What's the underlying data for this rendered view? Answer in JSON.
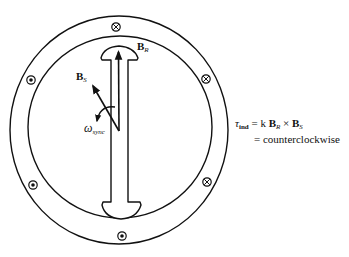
{
  "figure": {
    "type": "synchronous-machine-cross-section",
    "stroke_color": "#111111",
    "background": "#ffffff"
  },
  "stator": {
    "outer_ring": {
      "cx": 119,
      "cy": 130,
      "rx": 109,
      "ry": 114
    },
    "inner_ring": {
      "cx": 120,
      "cy": 127,
      "rx": 92,
      "ry": 91
    }
  },
  "conductors": [
    {
      "position": "top",
      "symbol": "cross",
      "meaning": "current-into-page",
      "x": 116,
      "y": 27
    },
    {
      "position": "upper-right",
      "symbol": "cross",
      "meaning": "current-into-page",
      "x": 206,
      "y": 79
    },
    {
      "position": "lower-right",
      "symbol": "cross",
      "meaning": "current-into-page",
      "x": 207,
      "y": 182
    },
    {
      "position": "bottom",
      "symbol": "dot",
      "meaning": "current-out-of-page",
      "x": 122,
      "y": 236
    },
    {
      "position": "lower-left",
      "symbol": "dot",
      "meaning": "current-out-of-page",
      "x": 33,
      "y": 185
    },
    {
      "position": "upper-left",
      "symbol": "dot",
      "meaning": "current-out-of-page",
      "x": 31,
      "y": 80
    }
  ],
  "labels": {
    "br": {
      "main": "B",
      "sub": "R"
    },
    "bs": {
      "main": "B",
      "sub": "S"
    },
    "omega": {
      "main": "ω",
      "sub": "sync"
    }
  },
  "equation": {
    "tau": "τ",
    "tau_sub": "ind",
    "line1_rest_k": "= k ",
    "b1": "B",
    "b1_sub": "R",
    "cross": " × ",
    "b2": "B",
    "b2_sub": "S",
    "line2": "= counterclockwise"
  }
}
